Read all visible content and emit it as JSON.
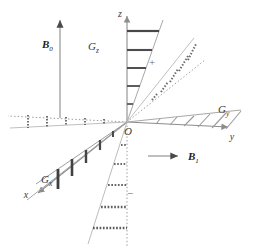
{
  "figure": {
    "type": "vector-diagram",
    "title": "",
    "background": "#ffffff",
    "width": 255,
    "height": 252
  },
  "colors": {
    "axis": "#8c8c8c",
    "axis_dotted": "#9a9a9a",
    "wedge_outline": "#a8a8a8",
    "rung_dark": "#4a4a4a",
    "rung_mid": "#6f6f6f",
    "hatch": "#9b9b9b",
    "dotted": "#6a6a6a",
    "text": "#3a3a3a",
    "arrow": "#7d7d7d"
  },
  "origin": {
    "label": "O",
    "x": 127,
    "y": 122
  },
  "axes": [
    {
      "name": "z-axis",
      "label": "z",
      "direction": "up",
      "label_x": 123,
      "label_y": 14
    },
    {
      "name": "y-axis",
      "label": "y",
      "direction": "right",
      "label_x": 232,
      "label_y": 137
    },
    {
      "name": "x-axis",
      "label": "x",
      "direction": "lower-left",
      "label_x": 27,
      "label_y": 196
    }
  ],
  "gradients": [
    {
      "name": "G_z",
      "label": "G",
      "subscript": "z",
      "label_x": 92,
      "label_y": 47,
      "rungs": "horizontal",
      "quadrant": "upper",
      "polarity": "+"
    },
    {
      "name": "G_y",
      "label": "G",
      "subscript": "y",
      "label_x": 222,
      "label_y": 110,
      "rungs": "diagonal-hatch",
      "quadrant": "right",
      "polarity": "+"
    },
    {
      "name": "G_x",
      "label": "G",
      "subscript": "x",
      "label_x": 45,
      "label_y": 180,
      "rungs": "vertical",
      "quadrant": "lower-left",
      "polarity": "+"
    }
  ],
  "polarity_marks": [
    {
      "name": "plus-sign",
      "symbol": "+",
      "x": 152,
      "y": 63
    },
    {
      "name": "minus-sign",
      "symbol": "−",
      "x": 130,
      "y": 194
    }
  ],
  "field_vectors": [
    {
      "name": "B0",
      "label": "B",
      "subscript": "0",
      "orientation": "vertical-up",
      "label_x": 48,
      "label_y": 44,
      "arrow_x": 60,
      "arrow_tail_y": 118,
      "arrow_head_y": 18
    },
    {
      "name": "B1",
      "label": "B",
      "subscript": "1",
      "orientation": "horizontal-right",
      "label_x": 193,
      "label_y": 158,
      "arrow_y": 156,
      "arrow_tail_x": 148,
      "arrow_head_x": 180
    }
  ]
}
